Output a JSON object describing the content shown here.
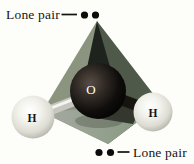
{
  "figure": {
    "background_color": "#fdfdfa",
    "top_annotation": {
      "label": "Lone pair",
      "dot_count": 2
    },
    "bottom_annotation": {
      "label": "Lone pair",
      "dot_count": 2
    },
    "atoms": {
      "oxygen": {
        "symbol": "O",
        "label_color": "#ffffff",
        "sphere_color": "#14110f"
      },
      "hydrogen_left": {
        "symbol": "H",
        "label_color": "#141414",
        "sphere_color": "#e9e9e1"
      },
      "hydrogen_right": {
        "symbol": "H",
        "label_color": "#141414",
        "sphere_color": "#e9e9e1"
      }
    },
    "tetrahedron_colors": {
      "left_face": "#8a947f",
      "right_face": "#4e594a",
      "bottom_face_left": "#a6a9a3",
      "bottom_face_right": "#7e9279",
      "apex_shadow_wedge": "#1f231d"
    },
    "bond_colors": {
      "left_bond": "#c6c6bf",
      "right_bond": "#17140f"
    },
    "lone_pair_dot_color": "#0c0c0c"
  }
}
